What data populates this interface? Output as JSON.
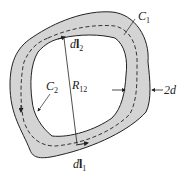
{
  "diagram": {
    "type": "thick conducting loop cross-section",
    "labels": {
      "c1": "C",
      "c1_sub": "1",
      "c2": "C",
      "c2_sub": "2",
      "dl2": "d",
      "dl2_bold": "l",
      "dl2_sub": "2",
      "dl1": "d",
      "dl1_bold": "l",
      "dl1_sub": "1",
      "r12": "R",
      "r12_sub": "12",
      "thickness": "2d"
    },
    "colors": {
      "band_fill": "#d4d4d4",
      "outline": "#222222",
      "background": "#ffffff"
    }
  }
}
